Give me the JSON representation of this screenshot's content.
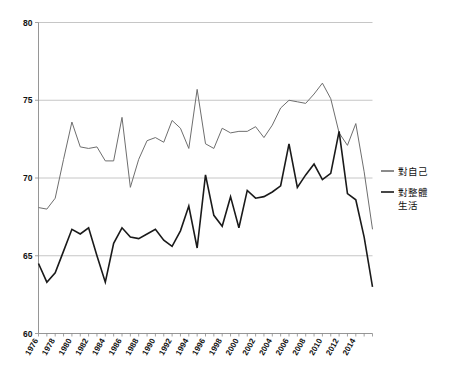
{
  "chart_data": {
    "type": "line",
    "title": "",
    "subtitle": "",
    "xlabel": "",
    "ylabel": "",
    "xlim": [
      1976,
      2016
    ],
    "ylim": [
      60,
      80
    ],
    "yticks": [
      60,
      65,
      70,
      75,
      80
    ],
    "ytick_labels": [
      "60",
      "65",
      "70",
      "75",
      "80"
    ],
    "grid": true,
    "grid_axis": "y",
    "legend_position": "right",
    "x": [
      1976,
      1977,
      1978,
      1979,
      1980,
      1981,
      1982,
      1983,
      1984,
      1985,
      1986,
      1987,
      1988,
      1989,
      1990,
      1991,
      1992,
      1993,
      1994,
      1995,
      1996,
      1997,
      1998,
      1999,
      2000,
      2001,
      2002,
      2003,
      2004,
      2005,
      2006,
      2007,
      2008,
      2009,
      2010,
      2011,
      2012,
      2013,
      2014,
      2015,
      2016
    ],
    "xtick_labels": [
      "1976",
      "1978",
      "1980",
      "1982",
      "1984",
      "1986",
      "1988",
      "1990",
      "1992",
      "1994",
      "1996",
      "1998",
      "2000",
      "2002",
      "2004",
      "2006",
      "2008",
      "2010",
      "2012",
      "2014"
    ],
    "xticks": [
      1976,
      1978,
      1980,
      1982,
      1984,
      1986,
      1988,
      1990,
      1992,
      1994,
      1996,
      1998,
      2000,
      2002,
      2004,
      2006,
      2008,
      2010,
      2012,
      2014
    ],
    "series": [
      {
        "name": "對自己",
        "color": "#6e6e6e",
        "width": 1.0,
        "values": [
          68.1,
          68.0,
          68.7,
          71.2,
          73.6,
          72.0,
          71.9,
          72.0,
          71.1,
          71.1,
          73.9,
          69.4,
          71.2,
          72.4,
          72.6,
          72.3,
          73.7,
          73.2,
          71.9,
          75.7,
          72.2,
          71.9,
          73.2,
          72.9,
          73.0,
          73.0,
          73.3,
          72.6,
          73.4,
          74.5,
          75.0,
          74.9,
          74.8,
          75.4,
          76.1,
          75.1,
          72.9,
          72.1,
          73.5,
          70.4,
          66.7
        ]
      },
      {
        "name": "對整體生活",
        "color": "#1a1a1a",
        "width": 1.6,
        "values": [
          64.5,
          63.3,
          63.9,
          65.3,
          66.7,
          66.4,
          66.8,
          65.0,
          63.3,
          65.8,
          66.8,
          66.2,
          66.1,
          66.4,
          66.7,
          66.0,
          65.6,
          66.6,
          68.2,
          65.5,
          70.2,
          67.6,
          66.9,
          68.8,
          66.8,
          69.2,
          68.7,
          68.8,
          69.1,
          69.5,
          72.2,
          69.4,
          70.2,
          70.9,
          69.9,
          70.3,
          73.0,
          69.0,
          68.6,
          66.2,
          63.0
        ]
      }
    ],
    "legend": [
      {
        "label": "對自己",
        "color": "#6e6e6e"
      },
      {
        "label": "對整體生活",
        "color": "#1a1a1a"
      }
    ]
  },
  "legend_block": {
    "entry1_label": "對自己",
    "entry2_line1": "對整體",
    "entry2_line2": "生活"
  }
}
